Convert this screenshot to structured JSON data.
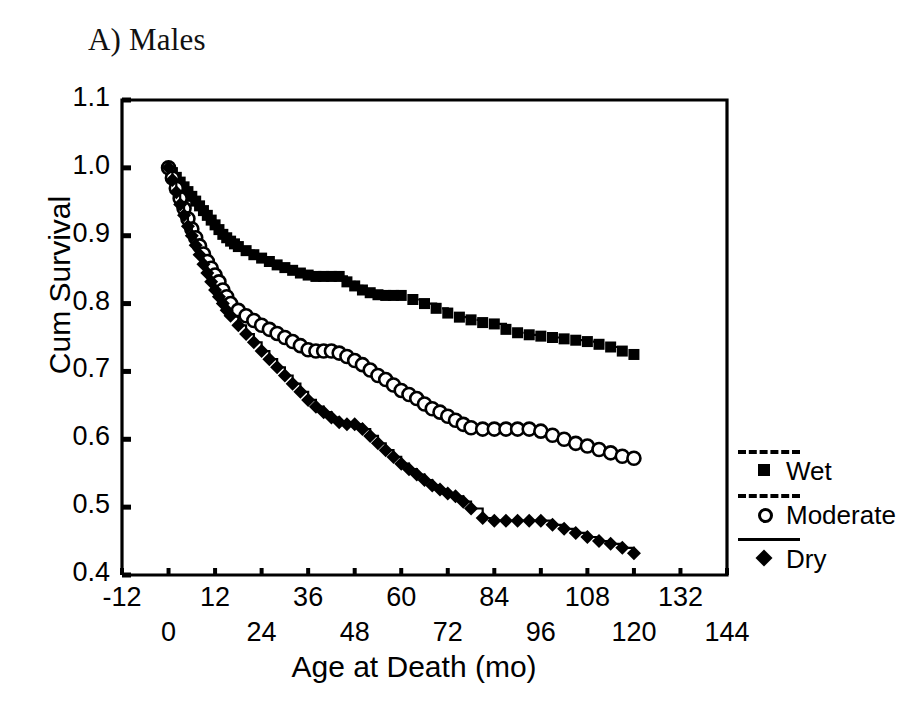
{
  "figure": {
    "panel_label": "A) Males"
  },
  "chart_data": {
    "type": "line",
    "title": "A) Males",
    "xlabel": "Age at Death (mo)",
    "ylabel": "Cum Survival",
    "xlim": [
      -12,
      144
    ],
    "ylim": [
      0.4,
      1.1
    ],
    "xticks": [
      -12,
      0,
      12,
      24,
      36,
      48,
      60,
      72,
      84,
      96,
      108,
      120,
      132,
      144
    ],
    "xtick_labels_upper": [
      "-12",
      "12",
      "36",
      "60",
      "84",
      "108",
      "132"
    ],
    "xtick_labels_lower": [
      "0",
      "24",
      "48",
      "72",
      "96",
      "120",
      "144"
    ],
    "yticks": [
      0.4,
      0.5,
      0.6,
      0.7,
      0.8,
      0.9,
      1.0,
      1.1
    ],
    "ytick_labels": [
      "0.4",
      "0.5",
      "0.6",
      "0.7",
      "0.8",
      "0.9",
      "1.0",
      "1.1"
    ],
    "grid": false,
    "legend_position": "right",
    "plot_style": "kaplan-meier step function with censoring markers",
    "series": [
      {
        "name": "Wet",
        "marker": "filled-square",
        "line_style": "dashed",
        "color": "#000000",
        "x": [
          0,
          1,
          2,
          3,
          4,
          5,
          6,
          7,
          8,
          9,
          10,
          11,
          12,
          13,
          14,
          15,
          16,
          17,
          18,
          20,
          22,
          24,
          26,
          28,
          30,
          32,
          34,
          36,
          38,
          40,
          42,
          44,
          46,
          48,
          50,
          52,
          54,
          56,
          58,
          60,
          63,
          66,
          69,
          72,
          75,
          78,
          81,
          84,
          87,
          90,
          93,
          96,
          99,
          102,
          105,
          108,
          111,
          114,
          117,
          120
        ],
        "y": [
          1.0,
          0.993,
          0.986,
          0.979,
          0.972,
          0.965,
          0.958,
          0.951,
          0.944,
          0.937,
          0.93,
          0.923,
          0.916,
          0.909,
          0.902,
          0.897,
          0.892,
          0.888,
          0.884,
          0.878,
          0.872,
          0.867,
          0.862,
          0.857,
          0.853,
          0.849,
          0.845,
          0.842,
          0.84,
          0.84,
          0.84,
          0.84,
          0.832,
          0.826,
          0.82,
          0.816,
          0.813,
          0.812,
          0.812,
          0.812,
          0.806,
          0.8,
          0.793,
          0.786,
          0.78,
          0.776,
          0.772,
          0.77,
          0.762,
          0.757,
          0.754,
          0.752,
          0.75,
          0.748,
          0.746,
          0.744,
          0.74,
          0.736,
          0.73,
          0.725
        ]
      },
      {
        "name": "Moderate",
        "marker": "open-circle",
        "line_style": "dashed",
        "color": "#000000",
        "x": [
          0,
          1,
          2,
          3,
          4,
          5,
          6,
          7,
          8,
          9,
          10,
          11,
          12,
          13,
          14,
          15,
          16,
          18,
          20,
          22,
          24,
          26,
          28,
          30,
          32,
          34,
          36,
          38,
          40,
          42,
          44,
          46,
          48,
          50,
          52,
          54,
          56,
          58,
          60,
          62,
          64,
          66,
          68,
          70,
          72,
          74,
          76,
          78,
          81,
          84,
          87,
          90,
          93,
          96,
          99,
          102,
          105,
          108,
          111,
          114,
          117,
          120
        ],
        "y": [
          1.0,
          0.985,
          0.97,
          0.955,
          0.94,
          0.925,
          0.91,
          0.897,
          0.885,
          0.873,
          0.862,
          0.852,
          0.842,
          0.832,
          0.82,
          0.81,
          0.8,
          0.79,
          0.782,
          0.775,
          0.768,
          0.762,
          0.756,
          0.75,
          0.744,
          0.738,
          0.732,
          0.73,
          0.73,
          0.73,
          0.727,
          0.722,
          0.716,
          0.71,
          0.702,
          0.694,
          0.688,
          0.68,
          0.672,
          0.666,
          0.66,
          0.652,
          0.645,
          0.64,
          0.634,
          0.628,
          0.622,
          0.617,
          0.615,
          0.615,
          0.615,
          0.615,
          0.615,
          0.612,
          0.606,
          0.6,
          0.594,
          0.59,
          0.585,
          0.58,
          0.575,
          0.572
        ]
      },
      {
        "name": "Dry",
        "marker": "filled-diamond",
        "line_style": "solid",
        "color": "#000000",
        "x": [
          0,
          1,
          2,
          3,
          4,
          5,
          6,
          7,
          8,
          9,
          10,
          11,
          12,
          13,
          14,
          15,
          16,
          18,
          20,
          22,
          24,
          26,
          28,
          30,
          32,
          34,
          36,
          38,
          40,
          42,
          44,
          46,
          48,
          50,
          52,
          54,
          56,
          58,
          60,
          62,
          64,
          66,
          68,
          70,
          72,
          74,
          76,
          78,
          81,
          84,
          87,
          90,
          93,
          96,
          99,
          102,
          105,
          108,
          111,
          114,
          117,
          120
        ],
        "y": [
          1.0,
          0.982,
          0.964,
          0.946,
          0.93,
          0.914,
          0.9,
          0.886,
          0.872,
          0.858,
          0.845,
          0.832,
          0.82,
          0.81,
          0.8,
          0.79,
          0.782,
          0.768,
          0.755,
          0.743,
          0.73,
          0.718,
          0.706,
          0.694,
          0.682,
          0.67,
          0.658,
          0.648,
          0.64,
          0.632,
          0.625,
          0.622,
          0.622,
          0.615,
          0.605,
          0.594,
          0.584,
          0.574,
          0.564,
          0.556,
          0.548,
          0.54,
          0.532,
          0.526,
          0.52,
          0.516,
          0.508,
          0.498,
          0.484,
          0.48,
          0.48,
          0.48,
          0.48,
          0.48,
          0.474,
          0.468,
          0.462,
          0.456,
          0.45,
          0.446,
          0.44,
          0.432
        ]
      }
    ],
    "legend_entries": [
      {
        "label": "Wet",
        "marker": "filled-square",
        "line_style": "dotted"
      },
      {
        "label": "Moderate",
        "marker": "open-circle",
        "line_style": "dashed"
      },
      {
        "label": "Dry",
        "marker": "filled-diamond",
        "line_style": "solid"
      }
    ]
  }
}
